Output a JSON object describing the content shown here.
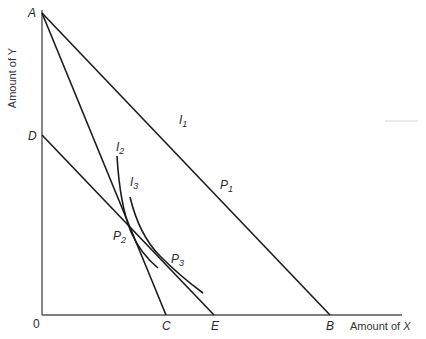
{
  "diagram": {
    "type": "budget-line / indifference-curve diagram",
    "axes": {
      "y_label": "Amount of Y",
      "x_label_prefix": "Amount of ",
      "x_label_var": "X",
      "origin": "0"
    },
    "points": {
      "A": "A",
      "D": "D",
      "B": "B",
      "C": "C",
      "E": "E"
    },
    "curve_labels": {
      "I1": {
        "base": "I",
        "sub": "1"
      },
      "I2": {
        "base": "I",
        "sub": "2"
      },
      "I3": {
        "base": "I",
        "sub": "3"
      }
    },
    "tangency_labels": {
      "P1": {
        "base": "P",
        "sub": "1"
      },
      "P2": {
        "base": "P",
        "sub": "2"
      },
      "P3": {
        "base": "P",
        "sub": "3"
      }
    },
    "lines": [
      {
        "name": "AB",
        "from": "A",
        "to": "B"
      },
      {
        "name": "AC",
        "from": "A",
        "to": "C"
      },
      {
        "name": "DE",
        "from": "D",
        "to": "E"
      }
    ],
    "colors": {
      "line": "#1c1c1c",
      "axis": "#555555",
      "background": "#ffffff"
    }
  }
}
